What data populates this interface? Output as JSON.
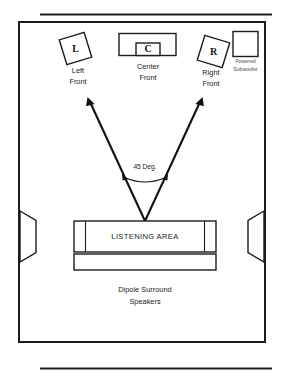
{
  "diagram": {
    "room": {
      "shape": "rectangle"
    },
    "speakers": {
      "left_front": {
        "glyph": "L",
        "label_line1": "Left",
        "label_line2": "Front"
      },
      "center_front": {
        "glyph": "C",
        "label_line1": "Center",
        "label_line2": "Front"
      },
      "right_front": {
        "glyph": "R",
        "label_line1": "Right",
        "label_line2": "Front"
      },
      "subwoofer": {
        "label_line1": "Powered",
        "label_line2": "Subwoofer"
      },
      "surround": {
        "label_line1": "Dipole Surround",
        "label_line2": "Speakers"
      }
    },
    "listening_area": {
      "label": "LISTENING AREA"
    },
    "angle": {
      "label": "45 Deg.",
      "value": 45,
      "unit": "degrees"
    },
    "colors": {
      "ink": "#1c1c1c",
      "background": "#ffffff",
      "muted_text": "#4a4a4a"
    }
  }
}
